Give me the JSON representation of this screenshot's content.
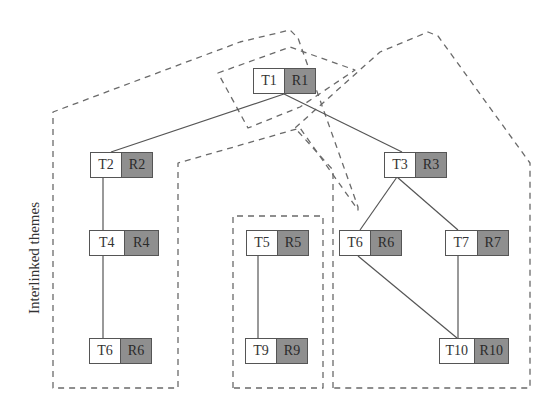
{
  "diagram": {
    "side_label": "Interlinked themes",
    "colors": {
      "theme_fill": "#ffffff",
      "resource_fill": "#8f8f8f",
      "edge": "#555555",
      "dashed_outline": "#6a6a6a"
    },
    "nodes": [
      {
        "id": "n1",
        "theme": "T1",
        "resource": "R1",
        "x": 253,
        "y": 68,
        "w": 63
      },
      {
        "id": "n2",
        "theme": "T2",
        "resource": "R2",
        "x": 90,
        "y": 152,
        "w": 63
      },
      {
        "id": "n3",
        "theme": "T3",
        "resource": "R3",
        "x": 384,
        "y": 152,
        "w": 63
      },
      {
        "id": "n4",
        "theme": "T4",
        "resource": "R4",
        "x": 89,
        "y": 230,
        "w": 70
      },
      {
        "id": "n5",
        "theme": "T5",
        "resource": "R5",
        "x": 246,
        "y": 230,
        "w": 63
      },
      {
        "id": "n6r",
        "theme": "T6",
        "resource": "R6",
        "x": 339,
        "y": 230,
        "w": 63
      },
      {
        "id": "n7",
        "theme": "T7",
        "resource": "R7",
        "x": 445,
        "y": 230,
        "w": 64
      },
      {
        "id": "n6l",
        "theme": "T6",
        "resource": "R6",
        "x": 89,
        "y": 338,
        "w": 63
      },
      {
        "id": "n9",
        "theme": "T9",
        "resource": "R9",
        "x": 245,
        "y": 338,
        "w": 63
      },
      {
        "id": "n10",
        "theme": "T10",
        "resource": "R10",
        "x": 439,
        "y": 338,
        "w": 70
      }
    ],
    "edges": [
      {
        "from": "T1",
        "to": "T2",
        "x1": 284,
        "y1": 94,
        "x2": 111,
        "y2": 152
      },
      {
        "from": "T1",
        "to": "T3",
        "x1": 284,
        "y1": 94,
        "x2": 402,
        "y2": 152
      },
      {
        "from": "T2",
        "to": "T4",
        "x1": 103,
        "y1": 177,
        "x2": 103,
        "y2": 230
      },
      {
        "from": "T4",
        "to": "T6",
        "x1": 103,
        "y1": 256,
        "x2": 103,
        "y2": 338
      },
      {
        "from": "T3",
        "to": "T6",
        "x1": 397,
        "y1": 177,
        "x2": 360,
        "y2": 230
      },
      {
        "from": "T3",
        "to": "T7",
        "x1": 397,
        "y1": 177,
        "x2": 458,
        "y2": 230
      },
      {
        "from": "T5",
        "to": "T9",
        "x1": 258,
        "y1": 255,
        "x2": 258,
        "y2": 338
      },
      {
        "from": "T6",
        "to": "T10",
        "x1": 358,
        "y1": 256,
        "x2": 457,
        "y2": 338
      },
      {
        "from": "T7",
        "to": "T10",
        "x1": 458,
        "y1": 256,
        "x2": 458,
        "y2": 338
      }
    ],
    "groups": [
      {
        "name": "left-theme-group",
        "points": "53,388 53,112 240,42 290,30 298,38 358,207 358,210 300,128 178,163 178,388"
      },
      {
        "name": "top-theme-group",
        "points": "218,73 290,47 355,70 300,107 248,128"
      },
      {
        "name": "middle-theme-group",
        "points": "233,388 233,216 323,216 323,388"
      },
      {
        "name": "right-theme-group",
        "points": "333,388 333,170 295,128 380,52 428,32 438,36 530,163 530,388"
      }
    ]
  }
}
